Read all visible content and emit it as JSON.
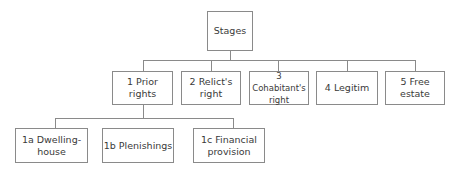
{
  "diagram": {
    "type": "tree",
    "root": {
      "label": "Stages"
    },
    "stages": [
      {
        "label": "1 Prior rights"
      },
      {
        "label": "2  Relict's right"
      },
      {
        "label": "3  Cohabitant's right"
      },
      {
        "label": "4  Legitim"
      },
      {
        "label": "5  Free estate"
      }
    ],
    "prior_rights_children": [
      {
        "label": "1a  Dwelling-house"
      },
      {
        "label": "1b Plenishings"
      },
      {
        "label": "1c  Financial provision"
      }
    ],
    "colors": {
      "border": "#8a8a8a",
      "text": "#3a3a3a",
      "background": "#ffffff"
    }
  }
}
